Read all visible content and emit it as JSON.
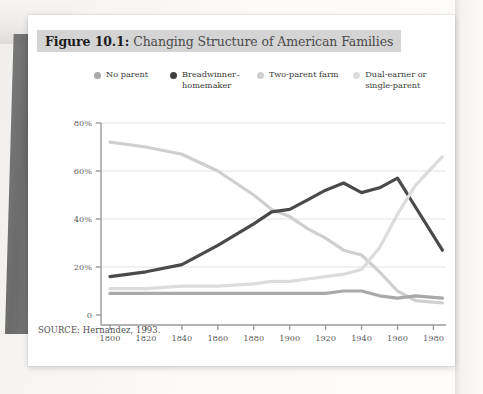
{
  "figure": {
    "label": "Figure 10.1:",
    "title": "Changing Structure of American Families",
    "source": "SOURCE: Hernandez, 1993."
  },
  "legend": {
    "items": [
      {
        "label": "No parent",
        "color": "#a9a9a9",
        "marker": "legend-dot"
      },
      {
        "label": "Breadwinner–\nhomemaker",
        "color": "#3f3f3f",
        "marker": "legend-dot"
      },
      {
        "label": "Two-parent farm",
        "color": "#cfcfcf",
        "marker": "legend-dot"
      },
      {
        "label": "Dual-earner or\nsingle-parent",
        "color": "#dcdcdc",
        "marker": "legend-dot"
      }
    ]
  },
  "chart_data": {
    "type": "line",
    "title": "Changing Structure of American Families",
    "xlabel": "",
    "ylabel": "",
    "xlim": [
      1795,
      1987
    ],
    "ylim": [
      0,
      80
    ],
    "grid": true,
    "legend_position": "top",
    "x_ticks": [
      1800,
      1820,
      1840,
      1860,
      1880,
      1900,
      1920,
      1940,
      1960,
      1980
    ],
    "y_ticks": [
      0,
      20,
      40,
      60,
      80
    ],
    "y_tick_labels": [
      "0",
      "20%",
      "40%",
      "60%",
      "80%"
    ],
    "x": [
      1800,
      1820,
      1840,
      1860,
      1880,
      1890,
      1900,
      1910,
      1920,
      1930,
      1940,
      1950,
      1960,
      1970,
      1985
    ],
    "series": [
      {
        "name": "Two-parent farm",
        "color": "#cfcfcf",
        "width": 3.2,
        "values": [
          72,
          70,
          67,
          60,
          50,
          44,
          41,
          36,
          32,
          27,
          25,
          18,
          10,
          6,
          5
        ]
      },
      {
        "name": "Breadwinner–homemaker",
        "color": "#4a4a4a",
        "width": 3.2,
        "values": [
          16,
          18,
          21,
          29,
          38,
          43,
          44,
          48,
          52,
          55,
          51,
          53,
          57,
          45,
          27
        ]
      },
      {
        "name": "Dual-earner or single-parent",
        "color": "#dcdcdc",
        "width": 3.2,
        "values": [
          11,
          11,
          12,
          12,
          13,
          14,
          14,
          15,
          16,
          17,
          19,
          28,
          42,
          54,
          66
        ]
      },
      {
        "name": "No parent",
        "color": "#a9a9a9",
        "width": 3.2,
        "values": [
          9,
          9,
          9,
          9,
          9,
          9,
          9,
          9,
          9,
          10,
          10,
          8,
          7,
          8,
          7
        ]
      }
    ]
  }
}
